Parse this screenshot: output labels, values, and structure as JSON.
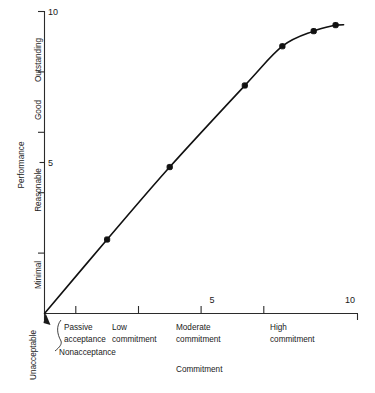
{
  "chart_data": {
    "type": "line",
    "title": "",
    "xlabel": "Commitment",
    "ylabel": "Performance",
    "xlim": [
      0,
      10
    ],
    "ylim": [
      0,
      10
    ],
    "grid": false,
    "legend": null,
    "x_tick_values": [
      "5",
      "10"
    ],
    "y_tick_values": [
      "5",
      "10"
    ],
    "x_category_labels": [
      {
        "line1": "Nonacceptance",
        "line2": ""
      },
      {
        "line1": "Passive",
        "line2": "acceptance"
      },
      {
        "line1": "Low",
        "line2": "commitment"
      },
      {
        "line1": "Moderate",
        "line2": "commitment"
      },
      {
        "line1": "High",
        "line2": "commitment"
      }
    ],
    "y_category_labels": [
      "Unacceptable",
      "Minimal",
      "Reasonable",
      "Good",
      "Outstanding"
    ],
    "series": [
      {
        "name": "Performance vs Commitment",
        "x": [
          0.0,
          2.0,
          4.0,
          6.4,
          7.6,
          8.6,
          9.3
        ],
        "y": [
          0.0,
          2.45,
          4.85,
          7.55,
          8.85,
          9.35,
          9.55
        ]
      }
    ],
    "annotation": "Nonacceptance"
  },
  "axis": {
    "y_title": "Performance",
    "x_title": "Commitment",
    "y_labels": {
      "outstanding": "Outstanding",
      "good": "Good",
      "reasonable": "Reasonable",
      "minimal": "Minimal",
      "unacceptable": "Unacceptable"
    },
    "y_ticks": {
      "five": "5",
      "ten": "10"
    },
    "x_ticks": {
      "five": "5",
      "ten": "10"
    },
    "x_cats": {
      "nonacceptance": "Nonacceptance",
      "passive_1": "Passive",
      "passive_2": "acceptance",
      "low_1": "Low",
      "low_2": "commitment",
      "moderate_1": "Moderate",
      "moderate_2": "commitment",
      "high_1": "High",
      "high_2": "commitment"
    }
  },
  "colors": {
    "ink": "#1a1a1a",
    "curve": "#111111",
    "background": "#ffffff"
  }
}
